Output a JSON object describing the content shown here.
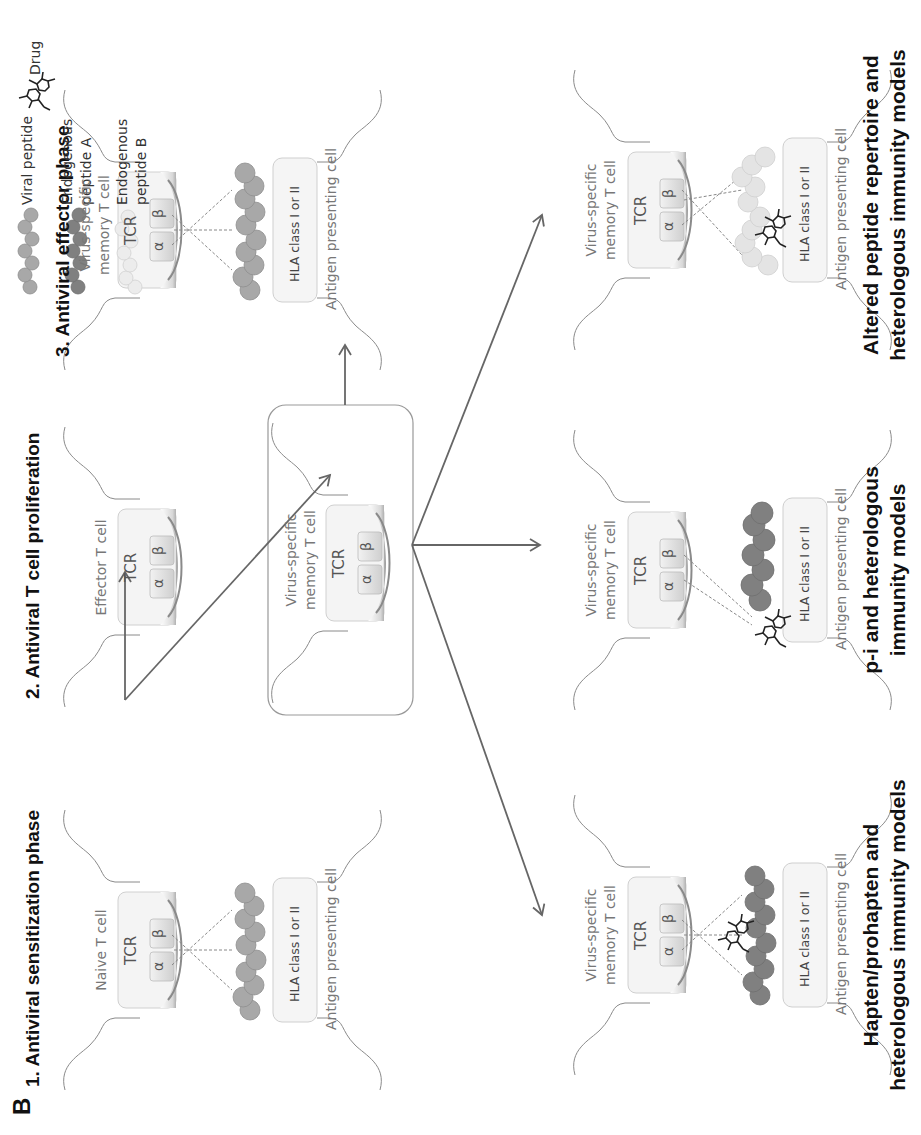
{
  "figure": {
    "panel_letter": "B",
    "phases": [
      {
        "id": "1",
        "title": "1. Antiviral sensitization phase"
      },
      {
        "id": "2",
        "title": "2. Antiviral T cell proliferation"
      },
      {
        "id": "3",
        "title": "3. Antiviral effector phase"
      }
    ],
    "models": [
      {
        "id": "hapten",
        "title_line1": "Hapten/prohapten and",
        "title_line2": "heterologous immunity models"
      },
      {
        "id": "pi",
        "title_line1": "p-i and heterologous",
        "title_line2": "immunity models"
      },
      {
        "id": "altered",
        "title_line1": "Altered peptide repertoire and",
        "title_line2": "heterologous immunity models"
      }
    ]
  },
  "cells": {
    "naive": {
      "line1": "Naive T cell",
      "line2": ""
    },
    "effector": {
      "line1": "Effector T cell",
      "line2": ""
    },
    "memory_line1": "Virus-specific",
    "memory_line2": "memory  T cell",
    "apc": "Antigen presenting cell",
    "tcr": "TCR",
    "alpha": "α",
    "beta": "β",
    "hla": "HLA class I or II"
  },
  "legend": {
    "items": [
      {
        "id": "viral",
        "line1": "Viral peptide",
        "line2": "",
        "color": "#a8a8a8"
      },
      {
        "id": "endoA",
        "line1": "Endogenous",
        "line2": "peptide A",
        "color": "#808080"
      },
      {
        "id": "endoB",
        "line1": "Endogenous",
        "line2": "peptide B",
        "color": "#e6e6e6"
      },
      {
        "id": "drug",
        "line1": "Drug",
        "line2": "",
        "color": "#222222"
      }
    ]
  },
  "colors": {
    "viral_peptide": "#a8a8a8",
    "endogenous_a": "#808080",
    "endogenous_b": "#e4e4e4",
    "arrow": "#666666",
    "membrane": "#888888",
    "box_border": "#999999"
  }
}
